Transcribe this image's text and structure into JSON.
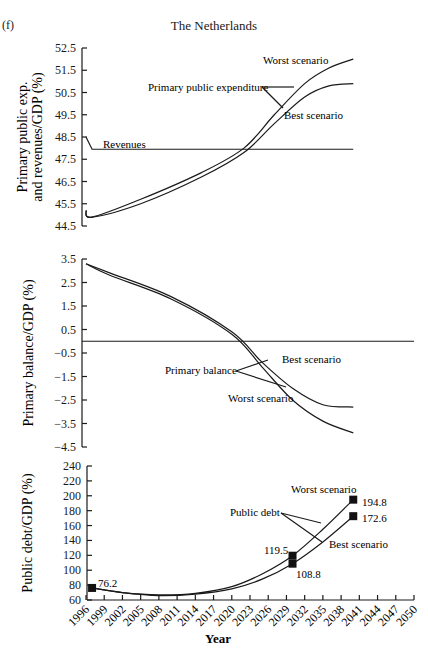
{
  "figure": {
    "panel_label": "(f)",
    "title": "The Netherlands",
    "xlabel": "Year"
  },
  "chart_data": [
    {
      "type": "line",
      "title": "The Netherlands",
      "ylabel": "Primary public exp. and revenues/GDP (%)",
      "ylabel_lines": [
        "Primary public exp.",
        "and revenues/GDP (%)"
      ],
      "xlabel": "",
      "ylim": [
        44.5,
        52.5
      ],
      "yticks": [
        "52.5",
        "51.5",
        "50.5",
        "49.5",
        "48.5",
        "47.5",
        "46.5",
        "45.5",
        "44.5"
      ],
      "grid": false,
      "series": [
        {
          "name": "Revenues",
          "x": [
            1996,
            1997,
            2040
          ],
          "values": [
            48.5,
            47.95,
            47.95
          ]
        },
        {
          "name": "Primary public expenditure - Worst scenario",
          "x": [
            1996,
            1997,
            2005,
            2015,
            2022,
            2027,
            2032,
            2036,
            2040
          ],
          "values": [
            45.2,
            44.9,
            45.7,
            46.9,
            48.0,
            49.5,
            50.9,
            51.6,
            52.0
          ]
        },
        {
          "name": "Primary public expenditure - Best scenario",
          "x": [
            1996,
            1997,
            2005,
            2015,
            2022,
            2027,
            2032,
            2036,
            2040
          ],
          "values": [
            45.2,
            44.9,
            45.5,
            46.7,
            47.8,
            49.1,
            50.3,
            50.8,
            50.9
          ]
        }
      ],
      "annotations": [
        "Worst scenario",
        "Primary public expenditure",
        "Best scenario",
        "Revenues"
      ]
    },
    {
      "type": "line",
      "ylabel": "Primary balance/GDP (%)",
      "xlabel": "",
      "ylim": [
        -4.5,
        3.5
      ],
      "yticks": [
        "3.5",
        "2.5",
        "1.5",
        "0.5",
        "-0.5",
        "-1.5",
        "-2.5",
        "-3.5",
        "-4.5"
      ],
      "grid": false,
      "reference_line": 0,
      "series": [
        {
          "name": "Primary balance - Best scenario",
          "x": [
            1996,
            2000,
            2010,
            2020,
            2025,
            2030,
            2035,
            2040
          ],
          "values": [
            3.3,
            2.9,
            1.9,
            0.4,
            -0.9,
            -2.0,
            -2.7,
            -2.8
          ]
        },
        {
          "name": "Primary balance - Worst scenario",
          "x": [
            1996,
            2000,
            2010,
            2020,
            2025,
            2030,
            2035,
            2040
          ],
          "values": [
            3.3,
            2.8,
            1.8,
            0.3,
            -1.1,
            -2.5,
            -3.4,
            -3.9
          ]
        }
      ],
      "annotations": [
        "Best scenario",
        "Primary balance",
        "Worst scenario"
      ]
    },
    {
      "type": "line",
      "ylabel": "Public debt/GDP (%)",
      "xlabel": "Year",
      "ylim": [
        60,
        240
      ],
      "yticks": [
        "240",
        "220",
        "200",
        "180",
        "160",
        "140",
        "120",
        "100",
        "80",
        "60"
      ],
      "xticks": [
        "1996",
        "1999",
        "2002",
        "2005",
        "2008",
        "2011",
        "2014",
        "2017",
        "2020",
        "2023",
        "2026",
        "2029",
        "2032",
        "2035",
        "2038",
        "2041",
        "2044",
        "2047",
        "2050"
      ],
      "grid": false,
      "series": [
        {
          "name": "Public debt - Worst scenario",
          "x": [
            1997,
            2002,
            2008,
            2014,
            2020,
            2025,
            2030,
            2035,
            2040
          ],
          "values": [
            76.2,
            70,
            67,
            69,
            78,
            95,
            119.5,
            155,
            194.8
          ]
        },
        {
          "name": "Public debt - Best scenario",
          "x": [
            1997,
            2002,
            2008,
            2014,
            2020,
            2025,
            2030,
            2035,
            2040
          ],
          "values": [
            76.2,
            70,
            66,
            68,
            75,
            88,
            108.8,
            138,
            172.6
          ]
        }
      ],
      "data_labels": [
        {
          "x": 1997,
          "value": "76.2"
        },
        {
          "x": 2030,
          "value": "119.5"
        },
        {
          "x": 2030,
          "value": "108.8"
        },
        {
          "x": 2040,
          "value": "194.8"
        },
        {
          "x": 2040,
          "value": "172.6"
        }
      ],
      "annotations": [
        "Worst scenario",
        "Public debt",
        "Best scenario"
      ]
    }
  ],
  "labels": {
    "top_worst": "Worst scenario",
    "top_ppe": "Primary public expenditure",
    "top_best": "Best scenario",
    "top_revenues": "Revenues",
    "mid_best": "Best scenario",
    "mid_pb": "Primary balance",
    "mid_worst": "Worst scenario",
    "bot_worst": "Worst scenario",
    "bot_pd": "Public debt",
    "bot_best": "Best scenario",
    "lbl_762": "76.2",
    "lbl_1195": "119.5",
    "lbl_1088": "108.8",
    "lbl_1948": "194.8",
    "lbl_1726": "172.6"
  }
}
